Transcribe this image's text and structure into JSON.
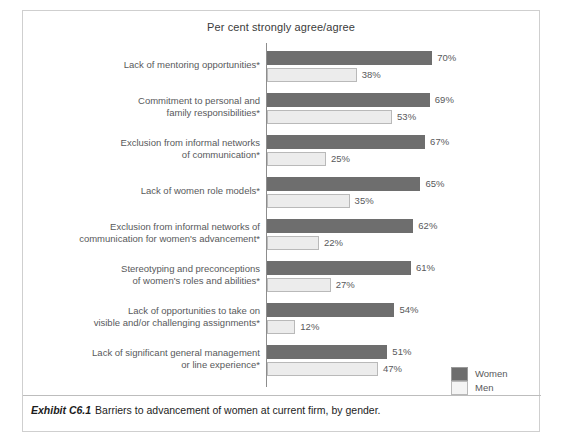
{
  "chart_title": "Per cent strongly agree/agree",
  "caption": {
    "exhibit_id": "Exhibit C6.1",
    "text": "Barriers to advancement of women at current firm, by gender."
  },
  "legend": {
    "position": "bottom-right",
    "entries": [
      {
        "label": "Women",
        "color": "#6e6e6e"
      },
      {
        "label": "Men",
        "color": "#ececec"
      }
    ]
  },
  "colors": {
    "women_bar": "#6e6e6e",
    "men_bar": "#ececec",
    "men_bar_border": "#b9b9b9",
    "axis": "#8d8d8d",
    "frame": "#cfcfcf",
    "label_text": "#58595b",
    "caption_text": "#1c1c1c"
  },
  "chart_data": {
    "type": "bar",
    "title": "Per cent strongly agree/agree",
    "xlabel": "",
    "ylabel": "",
    "xlim": [
      0,
      100
    ],
    "grid": false,
    "orientation": "horizontal",
    "legend_position": "bottom-right",
    "units": "%",
    "categories": [
      "Lack of mentoring opportunities*",
      "Commitment to personal and family responsibilities*",
      "Exclusion from informal networks of communication*",
      "Lack of women role models*",
      "Exclusion from informal networks of communication for women's advancement*",
      "Stereotyping and preconceptions of women's roles and abilities*",
      "Lack of opportunities to take on visible and/or challenging assignments*",
      "Lack of significant general management or line experience*"
    ],
    "category_lines": [
      [
        "Lack of mentoring opportunities*"
      ],
      [
        "Commitment to personal and",
        "family responsibilities*"
      ],
      [
        "Exclusion from informal networks",
        "of communication*"
      ],
      [
        "Lack of women role models*"
      ],
      [
        "Exclusion from informal networks of",
        "communication for women's advancement*"
      ],
      [
        "Stereotyping and preconceptions",
        "of women's roles and abilities*"
      ],
      [
        "Lack of opportunities to take on",
        "visible and/or challenging assignments*"
      ],
      [
        "Lack of significant general management",
        "or line experience*"
      ]
    ],
    "series": [
      {
        "name": "Women",
        "values": [
          70,
          69,
          67,
          65,
          62,
          61,
          54,
          51
        ]
      },
      {
        "name": "Men",
        "values": [
          38,
          53,
          25,
          35,
          22,
          27,
          12,
          47
        ]
      }
    ],
    "value_labels": {
      "Women": [
        "70%",
        "69%",
        "67%",
        "65%",
        "62%",
        "61%",
        "54%",
        "51%"
      ],
      "Men": [
        "38%",
        "53%",
        "25%",
        "35%",
        "22%",
        "27%",
        "12%",
        "47%"
      ]
    }
  }
}
